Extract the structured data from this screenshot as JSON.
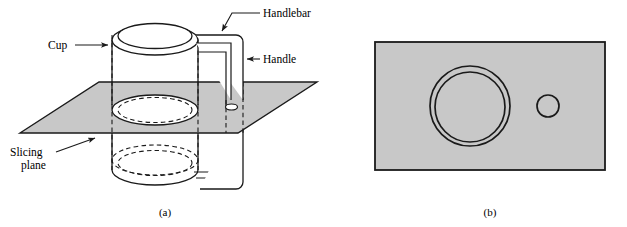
{
  "figure": {
    "domain": "diagram",
    "colors": {
      "plane_fill": "#c8c8c8",
      "rect_fill": "#c8c8c8",
      "stroke": "#1a1a1a",
      "background": "#ffffff"
    }
  },
  "panel_a": {
    "caption": "(a)",
    "labels": {
      "cup": "Cup",
      "handlebar": "Handlebar",
      "handle": "Handle",
      "slicing_plane_line1": "Slicing",
      "slicing_plane_line2": "plane"
    }
  },
  "panel_b": {
    "caption": "(b)",
    "shapes": {
      "cup_annulus": "cup-cross-section",
      "handle_circle": "handle-cross-section"
    }
  }
}
